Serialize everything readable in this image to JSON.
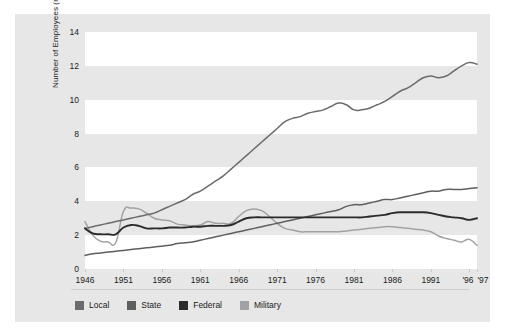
{
  "chart_data": {
    "type": "line",
    "title": "",
    "xlabel": "",
    "ylabel": "Number of Employees (millions)",
    "xlim": [
      1946,
      1997
    ],
    "ylim": [
      0,
      14
    ],
    "grid": "horizontal alternating white/gray bands every 2 million",
    "legend_position": "bottom-left",
    "y_ticks": [
      "0",
      "2",
      "4",
      "6",
      "8",
      "10",
      "12",
      "14"
    ],
    "y_tick_values": [
      0,
      2,
      4,
      6,
      8,
      10,
      12,
      14
    ],
    "x_ticks": [
      "1946",
      "1951",
      "1956",
      "1961",
      "1966",
      "1971",
      "1976",
      "1981",
      "1986",
      "1991",
      "'96",
      "'97"
    ],
    "x_tick_values": [
      1946,
      1951,
      1956,
      1961,
      1966,
      1971,
      1976,
      1981,
      1986,
      1991,
      1996,
      1997
    ],
    "x": [
      1946,
      1947,
      1948,
      1949,
      1950,
      1951,
      1952,
      1953,
      1954,
      1955,
      1956,
      1957,
      1958,
      1959,
      1960,
      1961,
      1962,
      1963,
      1964,
      1965,
      1966,
      1967,
      1968,
      1969,
      1970,
      1971,
      1972,
      1973,
      1974,
      1975,
      1976,
      1977,
      1978,
      1979,
      1980,
      1981,
      1982,
      1983,
      1984,
      1985,
      1986,
      1987,
      1988,
      1989,
      1990,
      1991,
      1992,
      1993,
      1994,
      1995,
      1996,
      1997
    ],
    "series": [
      {
        "name": "Local",
        "color": "#6b6b6b",
        "values": [
          2.4,
          2.5,
          2.6,
          2.7,
          2.8,
          2.9,
          3.0,
          3.1,
          3.2,
          3.3,
          3.5,
          3.7,
          3.9,
          4.1,
          4.4,
          4.6,
          4.9,
          5.2,
          5.5,
          5.9,
          6.3,
          6.7,
          7.1,
          7.5,
          7.9,
          8.3,
          8.7,
          8.9,
          9.0,
          9.2,
          9.3,
          9.4,
          9.6,
          9.8,
          9.7,
          9.4,
          9.4,
          9.5,
          9.7,
          9.9,
          10.2,
          10.5,
          10.7,
          11.0,
          11.3,
          11.4,
          11.3,
          11.4,
          11.7,
          12.0,
          12.2,
          12.1
        ]
      },
      {
        "name": "State",
        "color": "#5f5f5f",
        "values": [
          0.8,
          0.9,
          0.95,
          1.0,
          1.05,
          1.1,
          1.15,
          1.2,
          1.25,
          1.3,
          1.35,
          1.4,
          1.5,
          1.55,
          1.6,
          1.7,
          1.8,
          1.9,
          2.0,
          2.1,
          2.2,
          2.3,
          2.4,
          2.5,
          2.6,
          2.7,
          2.8,
          2.9,
          3.0,
          3.1,
          3.2,
          3.3,
          3.4,
          3.5,
          3.7,
          3.8,
          3.8,
          3.9,
          4.0,
          4.1,
          4.1,
          4.2,
          4.3,
          4.4,
          4.5,
          4.6,
          4.6,
          4.7,
          4.7,
          4.7,
          4.75,
          4.8
        ]
      },
      {
        "name": "Federal",
        "color": "#2b2b2b",
        "values": [
          2.4,
          2.1,
          2.05,
          2.05,
          2.05,
          2.45,
          2.6,
          2.55,
          2.4,
          2.4,
          2.4,
          2.45,
          2.45,
          2.45,
          2.5,
          2.5,
          2.55,
          2.55,
          2.55,
          2.6,
          2.8,
          3.0,
          3.05,
          3.05,
          3.05,
          3.05,
          3.05,
          3.05,
          3.05,
          3.05,
          3.05,
          3.05,
          3.05,
          3.05,
          3.05,
          3.05,
          3.05,
          3.1,
          3.15,
          3.2,
          3.3,
          3.35,
          3.35,
          3.35,
          3.35,
          3.3,
          3.2,
          3.1,
          3.05,
          3.0,
          2.9,
          3.0
        ]
      },
      {
        "name": "Military",
        "color": "#a2a2a2",
        "values": [
          2.8,
          2.0,
          1.65,
          1.6,
          1.55,
          3.4,
          3.6,
          3.55,
          3.3,
          3.0,
          2.9,
          2.85,
          2.65,
          2.6,
          2.55,
          2.6,
          2.8,
          2.7,
          2.7,
          2.7,
          3.1,
          3.45,
          3.55,
          3.45,
          3.1,
          2.7,
          2.4,
          2.3,
          2.2,
          2.2,
          2.2,
          2.2,
          2.2,
          2.2,
          2.25,
          2.3,
          2.35,
          2.4,
          2.45,
          2.5,
          2.5,
          2.45,
          2.4,
          2.35,
          2.3,
          2.2,
          1.95,
          1.8,
          1.7,
          1.6,
          1.75,
          1.4
        ]
      }
    ]
  },
  "axes": {
    "y_title": "Number of Employees (millions)",
    "y_ticks": [
      "0",
      "2",
      "4",
      "6",
      "8",
      "10",
      "12",
      "14"
    ],
    "x_ticks": [
      "1946",
      "1951",
      "1956",
      "1961",
      "1966",
      "1971",
      "1976",
      "1981",
      "1986",
      "1991",
      "'96",
      "'97"
    ]
  },
  "legend": {
    "items": [
      {
        "label": "Local",
        "color": "#6b6b6b"
      },
      {
        "label": "State",
        "color": "#5f5f5f"
      },
      {
        "label": "Federal",
        "color": "#2b2b2b"
      },
      {
        "label": "Military",
        "color": "#a2a2a2"
      }
    ]
  },
  "colors": {
    "figure_background": "#e7e7e7",
    "band_light": "#ffffff",
    "text": "#1a1a1a",
    "rule": "#cfcfcf"
  }
}
